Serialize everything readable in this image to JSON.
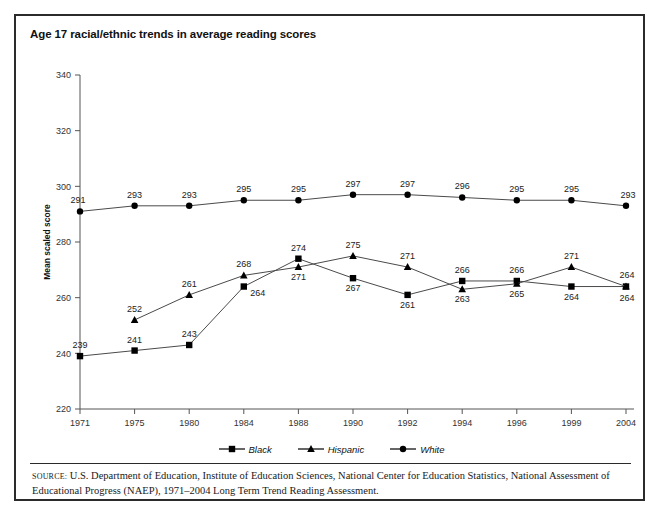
{
  "figure": {
    "title": "Age 17 racial/ethnic trends in average reading scores",
    "source_label": "SOURCE:",
    "source_text": "U.S. Department of Education, Institute of Education Sciences, National Center for Education Statistics, National Assessment of Educational Progress (NAEP), 1971–2004 Long Term Trend Reading Assessment."
  },
  "chart_data": {
    "type": "line",
    "title": "Age 17 racial/ethnic trends in average reading scores",
    "xlabel": "",
    "ylabel": "Mean scaled score",
    "categories": [
      "1971",
      "1975",
      "1980",
      "1984",
      "1988",
      "1990",
      "1992",
      "1994",
      "1996",
      "1999",
      "2004"
    ],
    "ylim": [
      220,
      340
    ],
    "yticks": [
      220,
      240,
      260,
      280,
      300,
      320,
      340
    ],
    "grid": false,
    "legend_position": "bottom",
    "series": [
      {
        "name": "Black",
        "marker": "square",
        "color": "#000000",
        "values": [
          239,
          241,
          243,
          264,
          274,
          267,
          261,
          266,
          266,
          264,
          264
        ]
      },
      {
        "name": "Hispanic",
        "marker": "triangle",
        "color": "#000000",
        "values": [
          null,
          252,
          261,
          268,
          271,
          275,
          271,
          263,
          265,
          271,
          264
        ]
      },
      {
        "name": "White",
        "marker": "circle",
        "color": "#000000",
        "values": [
          291,
          293,
          293,
          295,
          295,
          297,
          297,
          296,
          295,
          295,
          293
        ]
      }
    ]
  },
  "legend": {
    "items": [
      {
        "label": "Black",
        "marker": "square"
      },
      {
        "label": "Hispanic",
        "marker": "triangle"
      },
      {
        "label": "White",
        "marker": "circle"
      }
    ]
  }
}
